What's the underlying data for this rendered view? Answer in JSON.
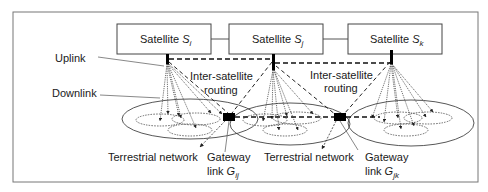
{
  "diagram": {
    "satellites": [
      {
        "id": "i",
        "label": "Satellite ",
        "symbol": "S",
        "subscript": "i"
      },
      {
        "id": "j",
        "label": "Satellite ",
        "symbol": "S",
        "subscript": "j"
      },
      {
        "id": "k",
        "label": "Satellite ",
        "symbol": "S",
        "subscript": "k"
      }
    ],
    "labels": {
      "uplink": "Uplink",
      "downlink": "Downlink",
      "isr1_line1": "Inter-satellite",
      "isr1_line2": "routing",
      "isr2_line1": "Inter-satellite",
      "isr2_line2": "routing",
      "terrestrial1": "Terrestrial network",
      "terrestrial2": "Terrestrial network",
      "gw1_line1": "Gateway",
      "gw1_line2": "link ",
      "gw1_symbol": "G",
      "gw1_sub": "ij",
      "gw2_line1": "Gateway",
      "gw2_line2": "link ",
      "gw2_symbol": "G",
      "gw2_sub": "jk"
    },
    "colors": {
      "stroke": "#333333",
      "frame": "#666666",
      "fill": "#ffffff",
      "node": "#000000"
    }
  }
}
